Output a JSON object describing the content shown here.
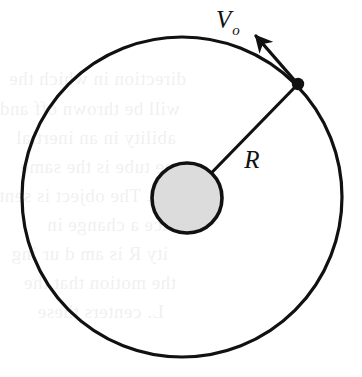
{
  "figure": {
    "kind": "physics-diagram",
    "background_color": "#ffffff",
    "stroke_color": "#111111"
  },
  "labels": {
    "velocity": {
      "base": "V",
      "subscript": "o",
      "full": "Vo",
      "x": 228,
      "y": 26,
      "font_size": 25,
      "sub_font_size": 15
    },
    "radius": {
      "base": "R",
      "full": "R",
      "x": 252,
      "y": 165,
      "font_size": 25
    }
  },
  "shapes": {
    "outer_circle": {
      "name": "orbit-path",
      "cx": 182,
      "cy": 197,
      "r": 160,
      "stroke": "#111111",
      "stroke_width": 3.2,
      "fill": "none"
    },
    "inner_circle": {
      "name": "central-body",
      "cx": 187,
      "cy": 198,
      "r": 35,
      "stroke": "#111111",
      "stroke_width": 3.6,
      "fill": "#dcdcdc"
    },
    "orbit_point": {
      "name": "orbiting-body",
      "cx": 298,
      "cy": 84,
      "r": 6.2,
      "fill": "#111111"
    },
    "radius_line": {
      "name": "radius-segment",
      "x1": 187,
      "y1": 198,
      "x2": 298,
      "y2": 84,
      "stroke": "#111111",
      "stroke_width": 3.2
    },
    "velocity_arrow": {
      "name": "velocity-vector",
      "x1": 296,
      "y1": 82,
      "x2": 254,
      "y2": 34,
      "stroke": "#111111",
      "stroke_width": 3.4,
      "head_length": 17,
      "head_width": 13
    }
  },
  "bleed_text": {
    "opacity": 0.055,
    "lines": [
      {
        "text": "direction in which the",
        "x": 186,
        "y": 82
      },
      {
        "text": "will be thrown off and",
        "x": 180,
        "y": 112
      },
      {
        "text": "ability in an inertial",
        "x": 176,
        "y": 141
      },
      {
        "text": "one tube is the same",
        "x": 184,
        "y": 170
      },
      {
        "text": "hose. The object is sent",
        "x": 188,
        "y": 199
      },
      {
        "text": "nce a change in",
        "x": 172,
        "y": 228
      },
      {
        "text": "ity R is am d ur ing",
        "x": 168,
        "y": 257
      },
      {
        "text": "the motion that the",
        "x": 176,
        "y": 286
      },
      {
        "text": "L. centers these",
        "x": 164,
        "y": 315
      }
    ]
  }
}
